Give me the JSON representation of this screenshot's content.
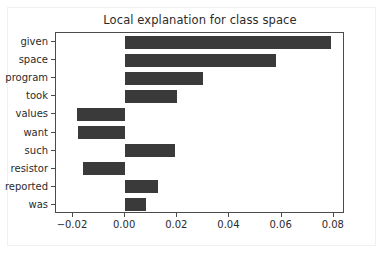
{
  "chart_data": {
    "type": "bar",
    "orientation": "horizontal",
    "title": "Local explanation for class space",
    "xlabel": "",
    "ylabel": "",
    "categories": [
      "given",
      "space",
      "program",
      "took",
      "values",
      "want",
      "such",
      "resistor",
      "reported",
      "was"
    ],
    "values": [
      0.079,
      0.058,
      0.0298,
      0.02,
      -0.0186,
      -0.0182,
      0.019,
      -0.0162,
      0.0128,
      0.0082
    ],
    "xlim": [
      -0.0265,
      0.0843
    ],
    "ylim_categories_top_to_bottom": true,
    "xticks": [
      -0.02,
      0.0,
      0.02,
      0.04,
      0.06,
      0.08
    ],
    "xtick_labels": [
      "−0.02",
      "0.00",
      "0.02",
      "0.04",
      "0.06",
      "0.08"
    ],
    "grid": false,
    "legend": null,
    "bar_color": "#3a3a3a",
    "axes_color": "#4b4b4b",
    "background_color": "#ffffff"
  }
}
